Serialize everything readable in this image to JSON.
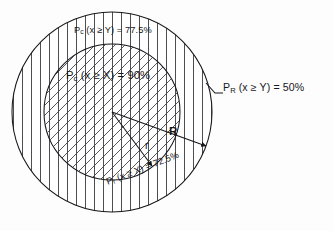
{
  "figure": {
    "background_color": "#fdfdfd",
    "stroke_color": "#17171a",
    "hatch_color": "#3a3a3e"
  },
  "labels": {
    "outer_annulus": {
      "prefix": "P",
      "subscript": "c",
      "expression": " (x ≥ Y) = ",
      "value": "77.5%",
      "full": "Pc (x ≥ Y) = 77.5%"
    },
    "inner_center": {
      "prefix": "P",
      "subscript": "c",
      "expression": " (x ≥ X) = ",
      "value": "90%",
      "full": "Pc (x ≥ X) = 90%"
    },
    "outer_right": {
      "prefix": "P",
      "subscript": "R",
      "expression": " (x ≥ Y) = ",
      "value": "50%",
      "full": "PR (x ≥ Y) = 50%"
    },
    "inner_bottom": {
      "prefix": "P",
      "subscript": "r",
      "expression": " (x ≥ X) = ",
      "value": "72.5%",
      "full": "Pr (x ≥ X) = 72.5%"
    },
    "radius_outer": "R",
    "radius_inner": "r"
  },
  "geometry": {
    "center_x": 112,
    "center_y": 112,
    "outer_radius": 100,
    "inner_radius": 68,
    "outer_fill_pattern": "vertical-lines",
    "inner_fill_pattern": "cross-hatch-vertical-and-diagonal",
    "hatch_spacing_px": 9
  }
}
